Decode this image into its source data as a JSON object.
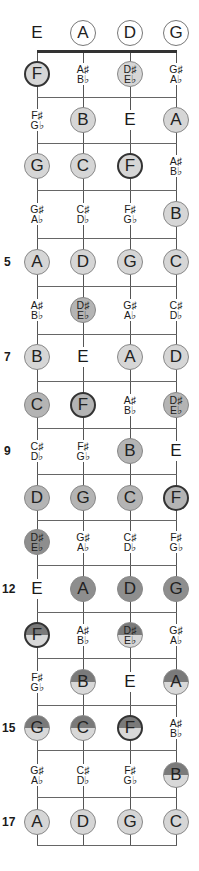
{
  "strings": [
    "E",
    "A",
    "D",
    "G"
  ],
  "string_x": [
    37,
    83,
    130,
    176
  ],
  "nut_y": 51,
  "fret_lines_y": [
    97,
    143,
    190,
    238,
    286,
    334,
    381,
    428,
    474,
    520,
    565,
    612,
    658,
    705,
    750,
    797,
    845
  ],
  "fret_numbers": [
    {
      "label": "5",
      "row": 5
    },
    {
      "label": "7",
      "row": 7
    },
    {
      "label": "9",
      "row": 9
    },
    {
      "label": "12",
      "row": 12
    },
    {
      "label": "15",
      "row": 15
    },
    {
      "label": "17",
      "row": 17
    }
  ],
  "row_y": [
    33,
    74,
    120,
    166,
    214,
    262,
    310,
    357,
    405,
    451,
    498,
    542,
    589,
    635,
    682,
    728,
    775,
    822
  ],
  "colors": {
    "light": "#d6d6d6",
    "mid": "#b4b4b4",
    "dark": "#8e8e8e",
    "top_dark": "#7a7a7a",
    "bottom_light": "#d8d8d8"
  },
  "rows": [
    [
      {
        "n": "E",
        "t": "plain"
      },
      {
        "n": "A",
        "t": "open"
      },
      {
        "n": "D",
        "t": "open"
      },
      {
        "n": "G",
        "t": "open"
      }
    ],
    [
      {
        "n": "F",
        "t": "dot",
        "shade": "light",
        "root": true
      },
      {
        "n": "A♯|B♭",
        "t": "pair"
      },
      {
        "n": "D♯|E♭",
        "t": "dot",
        "shade": "light"
      },
      {
        "n": "G♯|A♭",
        "t": "pair"
      }
    ],
    [
      {
        "n": "F♯|G♭",
        "t": "pair"
      },
      {
        "n": "B",
        "t": "dot",
        "shade": "light"
      },
      {
        "n": "E",
        "t": "plain"
      },
      {
        "n": "A",
        "t": "dot",
        "shade": "light"
      }
    ],
    [
      {
        "n": "G",
        "t": "dot",
        "shade": "light"
      },
      {
        "n": "C",
        "t": "dot",
        "shade": "light"
      },
      {
        "n": "F",
        "t": "dot",
        "shade": "light",
        "root": true
      },
      {
        "n": "A♯|B♭",
        "t": "pair"
      }
    ],
    [
      {
        "n": "G♯|A♭",
        "t": "pair"
      },
      {
        "n": "C♯|D♭",
        "t": "pair"
      },
      {
        "n": "F♯|G♭",
        "t": "pair"
      },
      {
        "n": "B",
        "t": "dot",
        "shade": "light"
      }
    ],
    [
      {
        "n": "A",
        "t": "dot",
        "shade": "light"
      },
      {
        "n": "D",
        "t": "dot",
        "shade": "light"
      },
      {
        "n": "G",
        "t": "dot",
        "shade": "light"
      },
      {
        "n": "C",
        "t": "dot",
        "shade": "light"
      }
    ],
    [
      {
        "n": "A♯|B♭",
        "t": "pair"
      },
      {
        "n": "D♯|E♭",
        "t": "dot",
        "shade": "mid"
      },
      {
        "n": "G♯|A♭",
        "t": "pair"
      },
      {
        "n": "C♯|D♭",
        "t": "pair"
      }
    ],
    [
      {
        "n": "B",
        "t": "dot",
        "shade": "light"
      },
      {
        "n": "E",
        "t": "plain"
      },
      {
        "n": "A",
        "t": "dot",
        "shade": "light"
      },
      {
        "n": "D",
        "t": "dot",
        "shade": "light"
      }
    ],
    [
      {
        "n": "C",
        "t": "dot",
        "shade": "mid"
      },
      {
        "n": "F",
        "t": "dot",
        "shade": "mid",
        "root": true
      },
      {
        "n": "A♯|B♭",
        "t": "pair"
      },
      {
        "n": "D♯|E♭",
        "t": "dot",
        "shade": "mid"
      }
    ],
    [
      {
        "n": "C♯|D♭",
        "t": "pair"
      },
      {
        "n": "F♯|G♭",
        "t": "pair"
      },
      {
        "n": "B",
        "t": "dot",
        "shade": "mid"
      },
      {
        "n": "E",
        "t": "plain"
      }
    ],
    [
      {
        "n": "D",
        "t": "dot",
        "shade": "mid"
      },
      {
        "n": "G",
        "t": "dot",
        "shade": "mid"
      },
      {
        "n": "C",
        "t": "dot",
        "shade": "mid"
      },
      {
        "n": "F",
        "t": "dot",
        "shade": "mid",
        "root": true
      }
    ],
    [
      {
        "n": "D♯|E♭",
        "t": "dot",
        "shade": "dark"
      },
      {
        "n": "G♯|A♭",
        "t": "pair"
      },
      {
        "n": "C♯|D♭",
        "t": "pair"
      },
      {
        "n": "F♯|G♭",
        "t": "pair"
      }
    ],
    [
      {
        "n": "E",
        "t": "plain"
      },
      {
        "n": "A",
        "t": "dot",
        "shade": "dark"
      },
      {
        "n": "D",
        "t": "dot",
        "shade": "dark"
      },
      {
        "n": "G",
        "t": "dot",
        "shade": "dark"
      }
    ],
    [
      {
        "n": "F",
        "t": "dot",
        "shade": "split",
        "root": true
      },
      {
        "n": "A♯|B♭",
        "t": "pair"
      },
      {
        "n": "D♯|E♭",
        "t": "dot",
        "shade": "split"
      },
      {
        "n": "G♯|A♭",
        "t": "pair"
      }
    ],
    [
      {
        "n": "F♯|G♭",
        "t": "pair"
      },
      {
        "n": "B",
        "t": "dot",
        "shade": "split"
      },
      {
        "n": "E",
        "t": "plain"
      },
      {
        "n": "A",
        "t": "dot",
        "shade": "split"
      }
    ],
    [
      {
        "n": "G",
        "t": "dot",
        "shade": "split"
      },
      {
        "n": "C",
        "t": "dot",
        "shade": "split"
      },
      {
        "n": "F",
        "t": "dot",
        "shade": "split",
        "root": true
      },
      {
        "n": "A♯|B♭",
        "t": "pair"
      }
    ],
    [
      {
        "n": "G♯|A♭",
        "t": "pair"
      },
      {
        "n": "C♯|D♭",
        "t": "pair"
      },
      {
        "n": "F♯|G♭",
        "t": "pair"
      },
      {
        "n": "B",
        "t": "dot",
        "shade": "split"
      }
    ],
    [
      {
        "n": "A",
        "t": "dot",
        "shade": "light"
      },
      {
        "n": "D",
        "t": "dot",
        "shade": "light"
      },
      {
        "n": "G",
        "t": "dot",
        "shade": "light"
      },
      {
        "n": "C",
        "t": "dot",
        "shade": "light"
      }
    ]
  ]
}
